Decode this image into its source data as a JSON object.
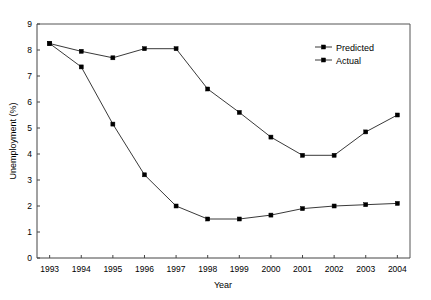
{
  "chart_data": {
    "type": "line",
    "title": "",
    "xlabel": "Year",
    "ylabel": "Unemployment (%)",
    "x": [
      1993,
      1994,
      1995,
      1996,
      1997,
      1998,
      1999,
      2000,
      2001,
      2002,
      2003,
      2004
    ],
    "xtick_labels": [
      "1993",
      "1994",
      "1995",
      "1996",
      "1997",
      "1998",
      "1999",
      "2000",
      "2001",
      "2002",
      "2003",
      "2004"
    ],
    "ytick_labels": [
      "0",
      "1",
      "2",
      "3",
      "4",
      "5",
      "6",
      "7",
      "8",
      "9"
    ],
    "yticks": [
      0,
      1,
      2,
      3,
      4,
      5,
      6,
      7,
      8,
      9
    ],
    "ylim": [
      0,
      9
    ],
    "xlim": [
      1992.6,
      2004.4
    ],
    "grid": false,
    "legend_position": "upper right",
    "series": [
      {
        "name": "Predicted",
        "marker": "plus",
        "color": "#222222",
        "values": [
          8.25,
          7.35,
          5.15,
          3.2,
          2.0,
          1.5,
          1.5,
          1.65,
          1.9,
          2.0,
          2.05,
          2.1
        ]
      },
      {
        "name": "Actual",
        "marker": "square",
        "color": "#000000",
        "values": [
          8.25,
          7.95,
          7.7,
          8.05,
          8.05,
          6.5,
          5.6,
          4.65,
          3.95,
          3.95,
          4.85,
          5.5
        ]
      }
    ]
  },
  "legend": {
    "entries": [
      {
        "label": "Predicted"
      },
      {
        "label": "Actual"
      }
    ]
  },
  "axes": {
    "y_title": "Unemployment (%)",
    "x_title": "Year"
  }
}
